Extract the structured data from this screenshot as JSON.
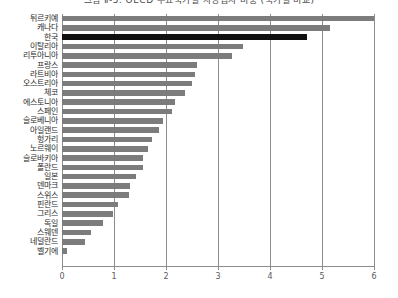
{
  "chart_data": {
    "type": "bar",
    "orientation": "horizontal",
    "title": "그림 Ⅱ-5. OECD 주요국가별 자영업자 비중 (국가별 비교)",
    "xlabel": "",
    "ylabel": "",
    "xlim": [
      0,
      6
    ],
    "xticks": [
      "0",
      "1",
      "2",
      "3",
      "4",
      "5",
      "6"
    ],
    "grid": true,
    "legend": "none",
    "highlight_category": "한국",
    "colors": {
      "bar": "#7c7c7c",
      "highlight": "#111111",
      "axis": "#8c8c8c",
      "text": "#2b2b2b"
    },
    "categories": [
      "튀르키예",
      "캐나다",
      "한국",
      "이탈리아",
      "리투아니아",
      "프랑스",
      "라트비아",
      "오스트리아",
      "체코",
      "에스토니아",
      "스페인",
      "슬로베니아",
      "아일랜드",
      "헝가리",
      "노르웨이",
      "슬로바키아",
      "폴란드",
      "일본",
      "덴마크",
      "스위스",
      "핀란드",
      "그리스",
      "독일",
      "스웨덴",
      "네덜란드",
      "벨기에"
    ],
    "values": [
      6.0,
      5.15,
      4.72,
      3.48,
      3.27,
      2.6,
      2.56,
      2.5,
      2.37,
      2.17,
      2.12,
      1.94,
      1.86,
      1.73,
      1.65,
      1.56,
      1.55,
      1.42,
      1.3,
      1.29,
      1.08,
      0.98,
      0.79,
      0.56,
      0.45,
      0.1
    ]
  }
}
